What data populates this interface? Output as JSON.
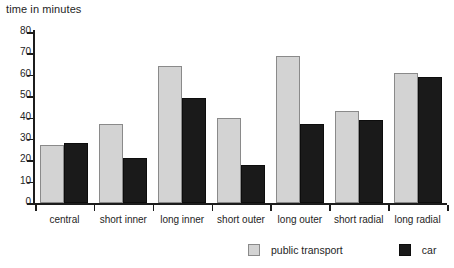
{
  "chart_data": {
    "type": "bar",
    "title": "time in minutes",
    "xlabel": "",
    "ylabel": "time in minutes",
    "ylim": [
      0,
      80
    ],
    "yticks": [
      0,
      10,
      20,
      30,
      40,
      50,
      60,
      70,
      80
    ],
    "grid": false,
    "legend_position": "bottom-right",
    "categories": [
      "central",
      "short inner",
      "long inner",
      "short outer",
      "long outer",
      "short radial",
      "long radial"
    ],
    "series": [
      {
        "name": "public transport",
        "color": "#d3d3d3",
        "values": [
          27,
          37,
          64,
          40,
          69,
          43,
          61
        ]
      },
      {
        "name": "car",
        "color": "#1a1a1a",
        "values": [
          28,
          21,
          49,
          18,
          37,
          39,
          59
        ]
      }
    ]
  },
  "legend": {
    "items": [
      {
        "label": "public transport",
        "swatch": "light-gray-square-icon"
      },
      {
        "label": "car",
        "swatch": "black-square-icon"
      }
    ]
  }
}
